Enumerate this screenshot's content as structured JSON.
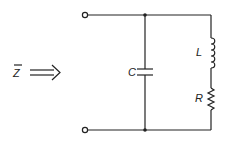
{
  "diagram": {
    "type": "circuit",
    "impedance_label": "Z",
    "impedance_overbar": true,
    "components": [
      {
        "id": "C",
        "label": "C",
        "kind": "capacitor",
        "branch": "left-parallel"
      },
      {
        "id": "L",
        "label": "L",
        "kind": "inductor",
        "branch": "right-series"
      },
      {
        "id": "R",
        "label": "R",
        "kind": "resistor",
        "branch": "right-series"
      }
    ],
    "terminals": 2,
    "topology": "C in parallel with series L-R"
  }
}
